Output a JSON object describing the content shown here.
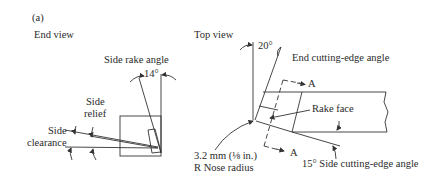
{
  "figure": {
    "label": "(a)"
  },
  "end_view": {
    "title": "End view",
    "labels": {
      "side_rake_angle": "Side rake angle",
      "rake_value": "14°",
      "side_relief_line1": "Side",
      "side_relief_line2": "relief",
      "side_clearance_line1": "Side",
      "side_clearance_line2": "clearance"
    }
  },
  "top_view": {
    "title": "Top view",
    "labels": {
      "end_angle_value": "20°",
      "end_cutting_edge_angle": "End cutting-edge angle",
      "section_a_top": "A",
      "section_a_bottom": "A",
      "rake_face": "Rake face",
      "side_cutting_edge_angle": "15° Side cutting-edge angle",
      "nose_radius_line1": "3.2 mm (⅛ in.)",
      "nose_radius_line2": "R Nose radius"
    }
  }
}
